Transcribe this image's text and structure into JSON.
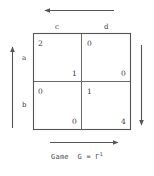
{
  "figure": {
    "caption_prefix": "Game",
    "caption_name": "G",
    "caption_equals": "=",
    "caption_symbol": "Γ",
    "caption_superscript": "1",
    "line_color": "#555555",
    "text_color": "#3a3a3a"
  },
  "matrix": {
    "row_labels": [
      "a",
      "b"
    ],
    "column_labels": [
      "c",
      "d"
    ],
    "cells": [
      [
        {
          "row": "a",
          "col": "c",
          "top_left": "2",
          "bottom_right": "1"
        },
        {
          "row": "a",
          "col": "d",
          "top_left": "0",
          "bottom_right": "0"
        }
      ],
      [
        {
          "row": "b",
          "col": "c",
          "top_left": "0",
          "bottom_right": "0"
        },
        {
          "row": "b",
          "col": "d",
          "top_left": "1",
          "bottom_right": "4"
        }
      ]
    ]
  },
  "arrows": {
    "top": {
      "direction": "left"
    },
    "bottom": {
      "direction": "right"
    },
    "left": {
      "direction": "up"
    },
    "right": {
      "direction": "down"
    }
  }
}
